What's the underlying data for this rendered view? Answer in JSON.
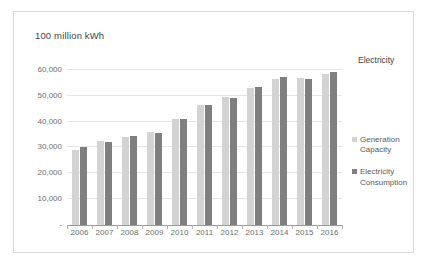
{
  "chart_data": {
    "type": "bar",
    "title": "100 million kWh",
    "subtitle": "",
    "xlabel": "",
    "ylabel": "100 million kWh",
    "categories": [
      "2006",
      "2007",
      "2008",
      "2009",
      "2010",
      "2011",
      "2012",
      "2013",
      "2014",
      "2015",
      "2016"
    ],
    "series": [
      {
        "name": "Generation Capacity",
        "color": "#d3d3d3",
        "values": [
          29000,
          32600,
          33900,
          36100,
          41100,
          46400,
          49700,
          53200,
          56600,
          56900,
          58600
        ]
      },
      {
        "name": "Electricity Consumption",
        "color": "#7f7f7f",
        "values": [
          30000,
          32300,
          34300,
          35700,
          41000,
          46500,
          49300,
          53400,
          57100,
          56600,
          59100
        ]
      }
    ],
    "ylim": [
      0,
      65000
    ],
    "yticks": [
      0,
      10000,
      20000,
      30000,
      40000,
      50000,
      60000
    ],
    "ytick_labels": [
      "-",
      "10,000",
      "20,000",
      "30,000",
      "40,000",
      "50,000",
      "60,000"
    ],
    "grid": true,
    "legend_position": "right",
    "annotations": [
      {
        "text": "Electricity",
        "position": "top-right"
      }
    ]
  },
  "legend": {
    "entries": [
      {
        "label": "Generation Capacity",
        "color": "#d3d3d3"
      },
      {
        "label": "Electricity Consumption",
        "color": "#7f7f7f"
      }
    ]
  },
  "colors": {
    "generation_capacity": "#d3d3d3",
    "electricity_consumption": "#7f7f7f",
    "gridline": "#e4e4e4",
    "axis": "#9a9a9a",
    "frame_border": "#d9d9d9",
    "label_text": "#6d6d6d"
  }
}
